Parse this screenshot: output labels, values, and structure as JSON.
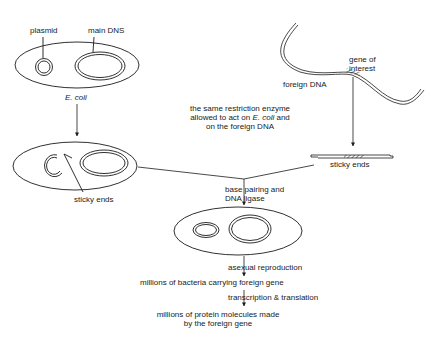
{
  "diagram": {
    "labels": {
      "plasmid": "plasmid",
      "main_dna": "main DNS",
      "ecoli": "E. coli",
      "foreign_dna": "foreign DNA",
      "gene_of_interest_1": "gene of",
      "gene_of_interest_2": "interest",
      "restriction_1": "the same restriction enzyme",
      "restriction_2a": "allowed to act on ",
      "restriction_2b": "E. coli",
      "restriction_2c": " and",
      "restriction_3": "on the foreign DNA",
      "sticky_ends_left": "sticky ends",
      "sticky_ends_right": "sticky ends",
      "base_pairing_1": "base pairing and",
      "base_pairing_2": "DNA ligase",
      "asexual": "asexual reproduction",
      "millions_bacteria": "millions of bacteria carrying foreign gene",
      "transcription": "transcription & translation",
      "millions_protein_1": "millions of protein molecules made",
      "millions_protein_2": "by the foreign gene"
    },
    "colors": {
      "stroke": "#1a1a1a",
      "background": "#ffffff"
    }
  }
}
